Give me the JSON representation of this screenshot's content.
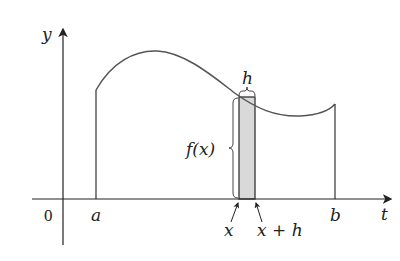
{
  "diagram": {
    "axes": {
      "x_label": "t",
      "y_label": "y",
      "origin_label": "0"
    },
    "points": {
      "a": "a",
      "b": "b",
      "x": "x",
      "x_plus_h": "x + h"
    },
    "annotations": {
      "height_label": "f(x)",
      "width_label": "h"
    },
    "colors": {
      "curve": "#555555",
      "strip_fill": "#d9d9d9",
      "axis": "#222222"
    }
  }
}
